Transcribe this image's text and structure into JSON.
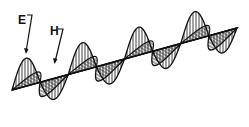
{
  "diagram": {
    "type": "electromagnetic-wave",
    "labels": {
      "e_field": "E",
      "h_field": "H"
    },
    "wave_cycles": 4,
    "colors": {
      "ink": "#111111",
      "background": "#ffffff"
    }
  }
}
